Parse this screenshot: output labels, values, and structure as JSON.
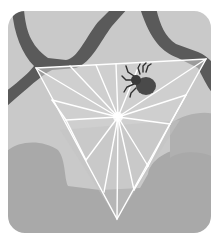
{
  "illustration": {
    "subject": "spider on triangular web between tree branches",
    "colors": {
      "sky": "#c9c9c9",
      "branch": "#5a5a5a",
      "cloud": "#a9a9a9",
      "web_fill": "#d2d2d2",
      "web_thread": "#ffffff",
      "spider_body": "#4a4a4a",
      "spider_legs": "#2e2e2e",
      "border": "#ffffff"
    },
    "web": {
      "corners": [
        [
          36,
          68
        ],
        [
          206,
          59
        ],
        [
          117,
          219
        ]
      ],
      "center": [
        118,
        117
      ]
    },
    "spider": {
      "x": 140,
      "y": 82
    }
  }
}
